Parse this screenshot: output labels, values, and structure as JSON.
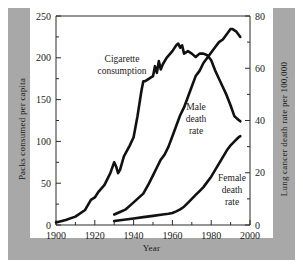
{
  "chart_data": {
    "type": "line",
    "title": "",
    "xlabel": "Year",
    "ylabel": "Packs consumed per capita",
    "y2label": "Lung cancer death rate per 100,000",
    "xlim": [
      1900,
      2000
    ],
    "ylim": [
      0,
      250
    ],
    "y2lim": [
      0,
      80
    ],
    "grid": false,
    "legend": "inline-annotations",
    "xticks": [
      1900,
      1920,
      1940,
      1960,
      1980,
      2000
    ],
    "xtick_labels": [
      "1900",
      "1920",
      "1940",
      "1960",
      "1980",
      "2000"
    ],
    "yticks": [
      0,
      50,
      100,
      150,
      200,
      250
    ],
    "ytick_labels": [
      "0",
      "50",
      "100",
      "150",
      "200",
      "250"
    ],
    "yminor_ticks": [
      25,
      75,
      125,
      175,
      225
    ],
    "y2ticks": [
      0,
      20,
      40,
      60,
      80
    ],
    "y2tick_labels": [
      "0",
      "20",
      "40",
      "60",
      "80"
    ],
    "y2minor_ticks": [
      10,
      30,
      50,
      70
    ],
    "series": [
      {
        "name": "Cigarette consumption",
        "axis": "left",
        "units": "packs consumed per capita",
        "annotation": [
          "Cigarette",
          "consumption"
        ],
        "x": [
          1900,
          1905,
          1910,
          1915,
          1918,
          1920,
          1922,
          1925,
          1928,
          1930,
          1931,
          1932,
          1933,
          1935,
          1938,
          1940,
          1942,
          1944,
          1945,
          1946,
          1948,
          1950,
          1951,
          1952,
          1953,
          1954,
          1955,
          1957,
          1960,
          1962,
          1963,
          1964,
          1965,
          1966,
          1968,
          1970,
          1972,
          1974,
          1976,
          1978,
          1980,
          1982,
          1984,
          1986,
          1988,
          1990,
          1992,
          1994,
          1995
        ],
        "y": [
          3,
          6,
          10,
          18,
          30,
          33,
          40,
          48,
          62,
          75,
          70,
          62,
          66,
          82,
          95,
          105,
          130,
          160,
          172,
          172,
          175,
          178,
          190,
          182,
          196,
          186,
          192,
          200,
          208,
          215,
          217,
          212,
          215,
          205,
          208,
          205,
          201,
          205,
          205,
          203,
          197,
          185,
          175,
          165,
          155,
          143,
          130,
          126,
          124
        ]
      },
      {
        "name": "Male death rate",
        "axis": "right",
        "units": "lung cancer deaths per 100,000",
        "annotation": [
          "Male",
          "death",
          "rate"
        ],
        "x": [
          1930,
          1933,
          1936,
          1939,
          1942,
          1945,
          1948,
          1950,
          1952,
          1954,
          1956,
          1958,
          1960,
          1962,
          1964,
          1966,
          1968,
          1970,
          1972,
          1974,
          1976,
          1978,
          1980,
          1982,
          1984,
          1986,
          1988,
          1990,
          1991,
          1993,
          1995
        ],
        "y": [
          4,
          5,
          6,
          8,
          10,
          12,
          16,
          19,
          22,
          25,
          27,
          30,
          34,
          38,
          42,
          45,
          49,
          53,
          57,
          59,
          62,
          64,
          66,
          68,
          70,
          71,
          73,
          75,
          75,
          74,
          72
        ]
      },
      {
        "name": "Female death rate",
        "axis": "right",
        "units": "lung cancer deaths per 100,000",
        "annotation": [
          "Female",
          "death",
          "rate"
        ],
        "x": [
          1930,
          1935,
          1940,
          1945,
          1950,
          1955,
          1958,
          1960,
          1962,
          1964,
          1966,
          1968,
          1970,
          1972,
          1974,
          1976,
          1978,
          1980,
          1982,
          1984,
          1986,
          1988,
          1990,
          1992,
          1994,
          1995
        ],
        "y": [
          1.5,
          2,
          2.5,
          3,
          3.5,
          4,
          4.3,
          4.6,
          5.2,
          6,
          7,
          8.5,
          10,
          11.5,
          13,
          14.5,
          16.5,
          18.5,
          21,
          23.5,
          26,
          28.5,
          30.5,
          32,
          33.5,
          34
        ]
      }
    ]
  }
}
